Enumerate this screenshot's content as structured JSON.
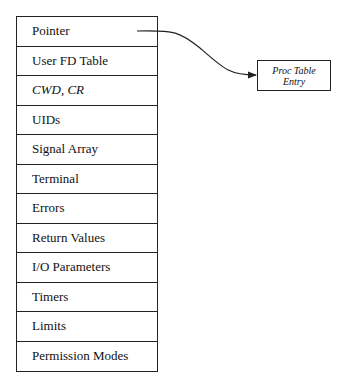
{
  "structure": {
    "rows": [
      {
        "label": "Pointer",
        "italic": false
      },
      {
        "label": "User FD Table",
        "italic": false
      },
      {
        "label": "CWD, CR",
        "italic": true
      },
      {
        "label": "UIDs",
        "italic": false
      },
      {
        "label": "Signal Array",
        "italic": false
      },
      {
        "label": "Terminal",
        "italic": false
      },
      {
        "label": "Errors",
        "italic": false
      },
      {
        "label": "Return Values",
        "italic": false
      },
      {
        "label": "I/O Parameters",
        "italic": false
      },
      {
        "label": "Timers",
        "italic": false
      },
      {
        "label": "Limits",
        "italic": false
      },
      {
        "label": "Permission Modes",
        "italic": false
      }
    ]
  },
  "target": {
    "line1": "Proc Table",
    "line2": "Entry"
  },
  "arrow": {
    "from": "Pointer",
    "to": "Proc Table Entry"
  }
}
